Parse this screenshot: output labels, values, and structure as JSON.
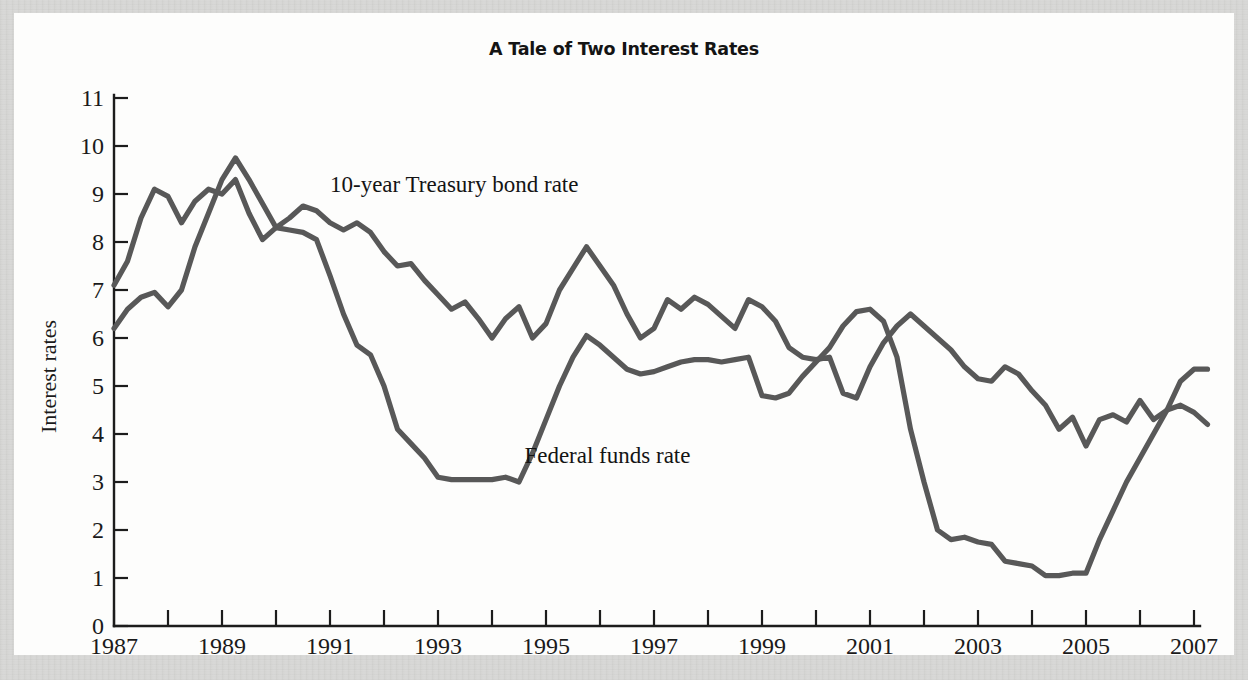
{
  "figure": {
    "title": "A Tale of Two Interest Rates",
    "line_color": "#585858",
    "axis_color": "#1c1c1c",
    "background": "#fdfdfc",
    "page_background": "#d9d9d7"
  },
  "labels": {
    "series_1": "10-year Treasury bond rate",
    "series_2": "Federal funds rate"
  },
  "chart_data": {
    "type": "line",
    "title": "A Tale of Two Interest Rates",
    "xlabel": "",
    "ylabel": "Interest rates",
    "xlim": [
      1987,
      2007.25
    ],
    "ylim": [
      0,
      11
    ],
    "yticks": [
      0,
      1,
      2,
      3,
      4,
      5,
      6,
      7,
      8,
      9,
      10,
      11
    ],
    "ytick_labels": [
      "0",
      "1",
      "2",
      "3",
      "4",
      "5",
      "6",
      "7",
      "8",
      "9",
      "10",
      "11"
    ],
    "xticks": [
      1987,
      1988,
      1989,
      1990,
      1991,
      1992,
      1993,
      1994,
      1995,
      1996,
      1997,
      1998,
      1999,
      2000,
      2001,
      2002,
      2003,
      2004,
      2005,
      2006,
      2007
    ],
    "xtick_labels": [
      "1987",
      "",
      "1989",
      "",
      "1991",
      "",
      "1993",
      "",
      "1995",
      "",
      "1997",
      "",
      "1999",
      "",
      "2001",
      "",
      "2003",
      "",
      "2005",
      "",
      "2007"
    ],
    "grid": false,
    "legend": "inline annotations",
    "series": [
      {
        "name": "10-year Treasury bond rate",
        "label_position": [
          1991.0,
          9.05
        ],
        "x": [
          1987.0,
          1987.25,
          1987.5,
          1987.75,
          1988.0,
          1988.25,
          1988.5,
          1988.75,
          1989.0,
          1989.25,
          1989.5,
          1989.75,
          1990.0,
          1990.25,
          1990.5,
          1990.75,
          1991.0,
          1991.25,
          1991.5,
          1991.75,
          1992.0,
          1992.25,
          1992.5,
          1992.75,
          1993.0,
          1993.25,
          1993.5,
          1993.75,
          1994.0,
          1994.25,
          1994.5,
          1994.75,
          1995.0,
          1995.25,
          1995.5,
          1995.75,
          1996.0,
          1996.25,
          1996.5,
          1996.75,
          1997.0,
          1997.25,
          1997.5,
          1997.75,
          1998.0,
          1998.25,
          1998.5,
          1998.75,
          1999.0,
          1999.25,
          1999.5,
          1999.75,
          2000.0,
          2000.25,
          2000.5,
          2000.75,
          2001.0,
          2001.25,
          2001.5,
          2001.75,
          2002.0,
          2002.25,
          2002.5,
          2002.75,
          2003.0,
          2003.25,
          2003.5,
          2003.75,
          2004.0,
          2004.25,
          2004.5,
          2004.75,
          2005.0,
          2005.25,
          2005.5,
          2005.75,
          2006.0,
          2006.25,
          2006.5,
          2006.75,
          2007.0,
          2007.25
        ],
        "y": [
          7.1,
          7.6,
          8.5,
          9.1,
          8.95,
          8.4,
          8.85,
          9.1,
          9.0,
          9.3,
          8.6,
          8.05,
          8.3,
          8.5,
          8.75,
          8.65,
          8.4,
          8.25,
          8.4,
          8.2,
          7.8,
          7.5,
          7.55,
          7.2,
          6.9,
          6.6,
          6.75,
          6.4,
          6.0,
          6.4,
          6.65,
          6.0,
          6.3,
          7.0,
          7.45,
          7.9,
          7.5,
          7.1,
          6.5,
          6.0,
          6.2,
          6.8,
          6.6,
          6.85,
          6.7,
          6.45,
          6.2,
          6.8,
          6.65,
          6.35,
          5.8,
          5.6,
          5.55,
          5.6,
          4.85,
          4.75,
          5.4,
          5.9,
          6.25,
          6.5,
          6.25,
          6.0,
          5.75,
          5.4,
          5.15,
          5.1,
          5.4,
          5.25,
          4.9,
          4.6,
          4.1,
          4.35,
          3.75,
          4.3,
          4.4,
          4.25,
          4.7,
          4.3,
          4.5,
          4.6,
          4.45,
          4.2
        ]
      },
      {
        "name": "Federal funds rate",
        "label_position": [
          1994.6,
          3.4
        ],
        "x": [
          1987.0,
          1987.25,
          1987.5,
          1987.75,
          1988.0,
          1988.25,
          1988.5,
          1988.75,
          1989.0,
          1989.25,
          1989.5,
          1989.75,
          1990.0,
          1990.25,
          1990.5,
          1990.75,
          1991.0,
          1991.25,
          1991.5,
          1991.75,
          1992.0,
          1992.25,
          1992.5,
          1992.75,
          1993.0,
          1993.25,
          1993.5,
          1993.75,
          1994.0,
          1994.25,
          1994.5,
          1994.75,
          1995.0,
          1995.25,
          1995.5,
          1995.75,
          1996.0,
          1996.25,
          1996.5,
          1996.75,
          1997.0,
          1997.25,
          1997.5,
          1997.75,
          1998.0,
          1998.25,
          1998.5,
          1998.75,
          1999.0,
          1999.25,
          1999.5,
          1999.75,
          2000.0,
          2000.25,
          2000.5,
          2000.75,
          2001.0,
          2001.25,
          2001.5,
          2001.75,
          2002.0,
          2002.25,
          2002.5,
          2002.75,
          2003.0,
          2003.25,
          2003.5,
          2003.75,
          2004.0,
          2004.25,
          2004.5,
          2004.75,
          2005.0,
          2005.25,
          2005.5,
          2005.75,
          2006.0,
          2006.25,
          2006.5,
          2006.75,
          2007.0,
          2007.25
        ],
        "y": [
          6.2,
          6.6,
          6.85,
          6.95,
          6.65,
          7.0,
          7.9,
          8.6,
          9.3,
          9.75,
          9.3,
          8.8,
          8.3,
          8.25,
          8.2,
          8.05,
          7.3,
          6.5,
          5.85,
          5.65,
          5.0,
          4.1,
          3.8,
          3.5,
          3.1,
          3.05,
          3.05,
          3.05,
          3.05,
          3.1,
          3.0,
          3.6,
          4.3,
          5.0,
          5.6,
          6.05,
          5.85,
          5.6,
          5.35,
          5.25,
          5.3,
          5.4,
          5.5,
          5.55,
          5.55,
          5.5,
          5.55,
          5.6,
          4.8,
          4.75,
          4.85,
          5.2,
          5.5,
          5.8,
          6.25,
          6.55,
          6.6,
          6.35,
          5.6,
          4.1,
          3.0,
          2.0,
          1.8,
          1.85,
          1.75,
          1.7,
          1.35,
          1.3,
          1.25,
          1.05,
          1.05,
          1.1,
          1.1,
          1.8,
          2.4,
          3.0,
          3.5,
          4.0,
          4.5,
          5.1,
          5.35,
          5.35
        ]
      }
    ]
  }
}
